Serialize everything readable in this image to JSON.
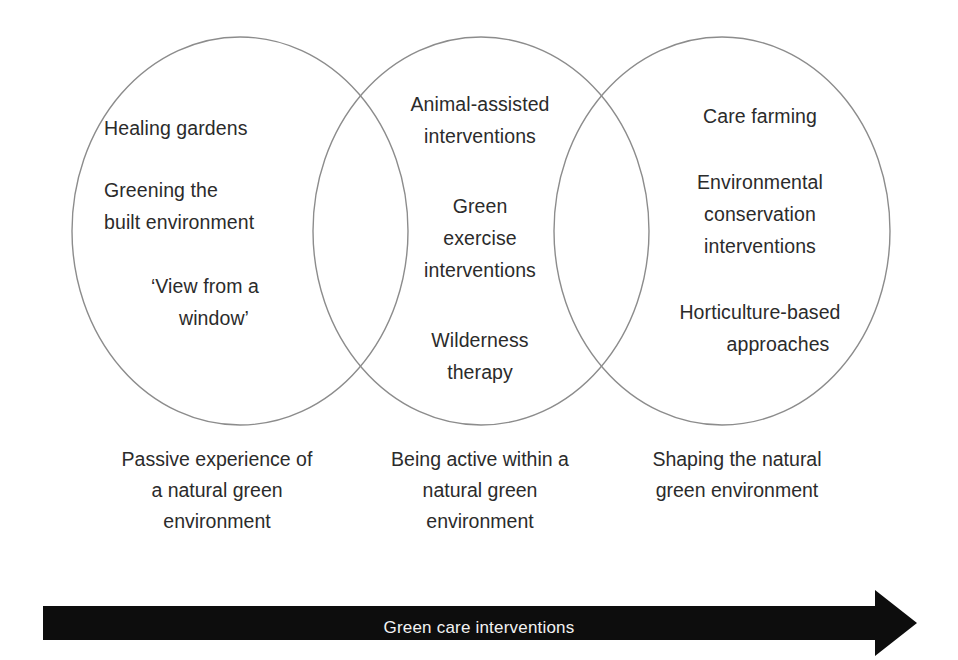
{
  "figure": {
    "type": "venn-diagram",
    "circle_count": 3,
    "stroke_color": "#8c8c8c",
    "text_color": "#2b2b2b",
    "background_color": "#ffffff"
  },
  "circles": [
    {
      "id": "passive",
      "position": "left",
      "entries": [
        {
          "lines": [
            "Healing gardens"
          ]
        },
        {
          "lines": [
            "Greening the",
            "built environment"
          ]
        },
        {
          "lines": [
            "‘View from a",
            "window’"
          ]
        }
      ],
      "caption": {
        "lines": [
          "Passive experience of",
          "a natural green",
          "environment"
        ]
      }
    },
    {
      "id": "active",
      "position": "middle",
      "entries": [
        {
          "lines": [
            "Animal-assisted",
            "interventions"
          ]
        },
        {
          "lines": [
            "Green",
            "exercise",
            "interventions"
          ]
        },
        {
          "lines": [
            "Wilderness",
            "therapy"
          ]
        }
      ],
      "caption": {
        "lines": [
          "Being active within a",
          "natural green",
          "environment"
        ]
      }
    },
    {
      "id": "shaping",
      "position": "right",
      "entries": [
        {
          "lines": [
            "Care farming"
          ]
        },
        {
          "lines": [
            "Environmental",
            "conservation",
            "interventions"
          ]
        },
        {
          "lines": [
            "Horticulture-based",
            "approaches"
          ]
        }
      ],
      "caption": {
        "lines": [
          "Shaping the natural",
          "green environment"
        ]
      }
    }
  ],
  "arrow": {
    "label": "Green care interventions",
    "fill_color": "#0d0d0d",
    "text_color": "#f2f2f2",
    "direction": "right"
  }
}
